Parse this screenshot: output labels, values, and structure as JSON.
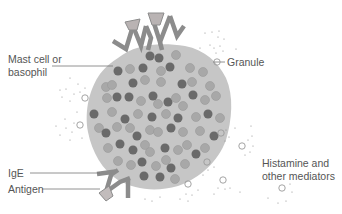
{
  "diagram": {
    "labels": {
      "mast_cell": "Mast cell or",
      "mast_cell_2": "basophil",
      "granule": "Granule",
      "ige": "IgE",
      "antigen": "Antigen",
      "mediators": "Histamine and",
      "mediators_2": "other mediators"
    },
    "colors": {
      "cell_body": "#c4c4c4",
      "granule_dark": "#6a6a6a",
      "granule_light": "#a8a8a8",
      "antibody": "#8c8c8c",
      "antigen": "#b9b3b3",
      "label_text": "#555555",
      "leader_line": "#777777"
    }
  }
}
